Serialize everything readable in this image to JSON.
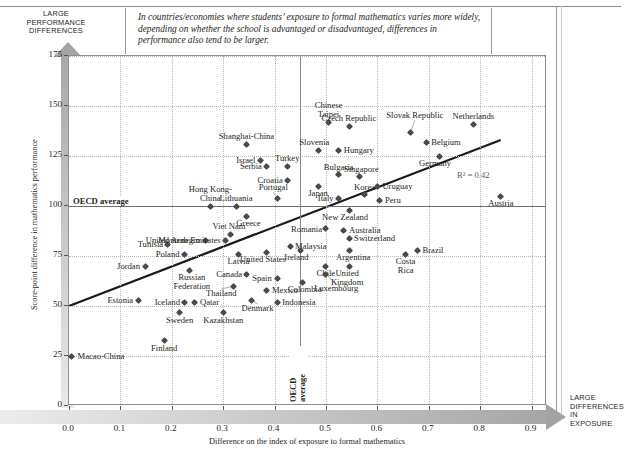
{
  "callouts": {
    "top_left": "LARGE PERFORMANCE DIFFERENCES",
    "bottom_right": "LARGE DIFFERENCES IN EXPOSURE"
  },
  "caption": "In countries/economies where students’ exposure to formal mathematics varies more widely, depending on whether the school is advantaged or disadvantaged, differences in performance also tend to be larger.",
  "annotations": {
    "oecd_average_horizontal": "OECD average",
    "oecd_average_vertical": "OECD average",
    "r_squared": "R² = 0.42"
  },
  "chart_data": {
    "type": "scatter",
    "title": "",
    "xlabel": "Difference on the index of exposure to formal mathematics",
    "ylabel": "Score-point difference in mathematics performance",
    "xlim": [
      0.0,
      0.93
    ],
    "ylim": [
      0,
      175
    ],
    "xticks": [
      "0.0",
      "0.1",
      "0.2",
      "0.3",
      "0.4",
      "0.5",
      "0.6",
      "0.7",
      "0.8",
      "0.9"
    ],
    "xtickvals": [
      0.0,
      0.1,
      0.2,
      0.3,
      0.4,
      0.5,
      0.6,
      0.7,
      0.8,
      0.9
    ],
    "yticks": [
      "0",
      "25",
      "50",
      "75",
      "100",
      "125",
      "150",
      "175"
    ],
    "ytickvals": [
      0,
      25,
      50,
      75,
      100,
      125,
      150,
      175
    ],
    "grid": true,
    "legend": "none",
    "reference_lines": {
      "oecd_average_y": 100,
      "oecd_average_x": 0.45
    },
    "trendline": {
      "x0": 0.0,
      "y0": 50,
      "x1": 0.84,
      "y1": 133,
      "r_squared": 0.42
    },
    "points": [
      {
        "name": "Macao-China",
        "x": 0.005,
        "y": 25,
        "lx": 1,
        "ly": 0,
        "anchor": "left"
      },
      {
        "name": "Finland",
        "x": 0.185,
        "y": 33,
        "lx": 0,
        "ly": 1,
        "anchor": "center"
      },
      {
        "name": "Estonia",
        "x": 0.135,
        "y": 53,
        "lx": -1,
        "ly": 0,
        "anchor": "right"
      },
      {
        "name": "Iceland",
        "x": 0.225,
        "y": 52,
        "lx": -1,
        "ly": 0,
        "anchor": "right"
      },
      {
        "name": "Qatar",
        "x": 0.245,
        "y": 52,
        "lx": 1,
        "ly": 0,
        "anchor": "left"
      },
      {
        "name": "Sweden",
        "x": 0.215,
        "y": 47,
        "lx": 0,
        "ly": 1,
        "anchor": "center"
      },
      {
        "name": "Kazakhstan",
        "x": 0.3,
        "y": 47,
        "lx": 0,
        "ly": 1,
        "anchor": "center"
      },
      {
        "name": "Denmark",
        "x": 0.355,
        "y": 53,
        "lx": 1,
        "ly": 0,
        "anchor": "left"
      },
      {
        "name": "Thailand",
        "x": 0.32,
        "y": 60,
        "lx": 0,
        "ly": 1,
        "anchor": "center"
      },
      {
        "name": "Mexico",
        "x": 0.385,
        "y": 58,
        "lx": 1,
        "ly": 0,
        "anchor": "left"
      },
      {
        "name": "Indonesia",
        "x": 0.405,
        "y": 52,
        "lx": 1,
        "ly": 0,
        "anchor": "left"
      },
      {
        "name": "Spain",
        "x": 0.405,
        "y": 64,
        "lx": -1,
        "ly": 0,
        "anchor": "right"
      },
      {
        "name": "Canada",
        "x": 0.345,
        "y": 66,
        "lx": -1,
        "ly": 0,
        "anchor": "right"
      },
      {
        "name": "Russian Federation",
        "x": 0.235,
        "y": 68,
        "lx": 0,
        "ly": 1,
        "anchor": "center"
      },
      {
        "name": "Jordan",
        "x": 0.148,
        "y": 70,
        "lx": -1,
        "ly": 0,
        "anchor": "right"
      },
      {
        "name": "Poland",
        "x": 0.225,
        "y": 76,
        "lx": -1,
        "ly": 0,
        "anchor": "right"
      },
      {
        "name": "Tunisia",
        "x": 0.192,
        "y": 81,
        "lx": -1,
        "ly": 0,
        "anchor": "right"
      },
      {
        "name": "Montenegro",
        "x": 0.265,
        "y": 83,
        "lx": -1,
        "ly": 0,
        "anchor": "right"
      },
      {
        "name": "Latvia",
        "x": 0.33,
        "y": 76,
        "lx": 0,
        "ly": 1,
        "anchor": "center"
      },
      {
        "name": "United States",
        "x": 0.385,
        "y": 77,
        "lx": 0,
        "ly": 1,
        "anchor": "center"
      },
      {
        "name": "Malaysia",
        "x": 0.43,
        "y": 80,
        "lx": 1,
        "ly": 0,
        "anchor": "left"
      },
      {
        "name": "Colombia",
        "x": 0.455,
        "y": 62,
        "lx": -1,
        "ly": 0,
        "anchor": "right"
      },
      {
        "name": "Chile",
        "x": 0.5,
        "y": 70,
        "lx": 0,
        "ly": 1,
        "anchor": "center"
      },
      {
        "name": "United Kingdom",
        "x": 0.545,
        "y": 70,
        "lx": 0,
        "ly": 1,
        "anchor": "center"
      },
      {
        "name": "Argentina",
        "x": 0.545,
        "y": 78,
        "lx": 0,
        "ly": 1,
        "anchor": "center"
      },
      {
        "name": "Luxembourg",
        "x": 0.5,
        "y": 66,
        "lx": 0,
        "ly": 1,
        "anchor": "center"
      },
      {
        "name": "Costa Rica",
        "x": 0.655,
        "y": 76,
        "lx": 0,
        "ly": 1,
        "anchor": "center"
      },
      {
        "name": "Brazil",
        "x": 0.678,
        "y": 78,
        "lx": 1,
        "ly": 0,
        "anchor": "left"
      },
      {
        "name": "Switzerland",
        "x": 0.545,
        "y": 84,
        "lx": 1,
        "ly": 0,
        "anchor": "left"
      },
      {
        "name": "Australia",
        "x": 0.535,
        "y": 88,
        "lx": 1,
        "ly": 0,
        "anchor": "left"
      },
      {
        "name": "Romania",
        "x": 0.5,
        "y": 89,
        "lx": -1,
        "ly": 0,
        "anchor": "right"
      },
      {
        "name": "Ireland",
        "x": 0.45,
        "y": 78,
        "lx": 0,
        "ly": 1,
        "anchor": "center"
      },
      {
        "name": "New Zealand",
        "x": 0.545,
        "y": 98,
        "lx": 0,
        "ly": 1,
        "anchor": "center"
      },
      {
        "name": "Italy",
        "x": 0.525,
        "y": 104,
        "lx": -1,
        "ly": 0,
        "anchor": "right"
      },
      {
        "name": "Peru",
        "x": 0.605,
        "y": 103,
        "lx": 1,
        "ly": 0,
        "anchor": "left"
      },
      {
        "name": "Uruguay",
        "x": 0.6,
        "y": 110,
        "lx": 1,
        "ly": 0,
        "anchor": "left"
      },
      {
        "name": "Austria",
        "x": 0.84,
        "y": 105,
        "lx": 0,
        "ly": 1,
        "anchor": "center"
      },
      {
        "name": "Korea",
        "x": 0.575,
        "y": 106,
        "lx": 0,
        "ly": 1,
        "anchor": "center"
      },
      {
        "name": "Japan",
        "x": 0.485,
        "y": 110,
        "lx": 0,
        "ly": 1,
        "anchor": "center"
      },
      {
        "name": "Singapore",
        "x": 0.565,
        "y": 115,
        "lx": 0,
        "ly": 1,
        "anchor": "center"
      },
      {
        "name": "Bulgaria",
        "x": 0.525,
        "y": 116,
        "lx": 0,
        "ly": 1,
        "anchor": "center"
      },
      {
        "name": "Greece",
        "x": 0.345,
        "y": 95,
        "lx": 0,
        "ly": 1,
        "anchor": "center"
      },
      {
        "name": "Viet Nam",
        "x": 0.315,
        "y": 86,
        "lx": 0,
        "ly": 1,
        "anchor": "center"
      },
      {
        "name": "United Arab Emirates",
        "x": 0.305,
        "y": 83,
        "lx": -1,
        "ly": 0,
        "anchor": "right"
      },
      {
        "name": "Lithuania",
        "x": 0.325,
        "y": 100,
        "lx": 0,
        "ly": 1,
        "anchor": "center"
      },
      {
        "name": "Hong Kong-China",
        "x": 0.275,
        "y": 100,
        "lx": 0,
        "ly": 1,
        "anchor": "center"
      },
      {
        "name": "Portugal",
        "x": 0.405,
        "y": 104,
        "lx": 0,
        "ly": 1,
        "anchor": "center"
      },
      {
        "name": "Croatia",
        "x": 0.425,
        "y": 113,
        "lx": -1,
        "ly": 0,
        "anchor": "right"
      },
      {
        "name": "Serbia",
        "x": 0.385,
        "y": 120,
        "lx": -1,
        "ly": 0,
        "anchor": "right"
      },
      {
        "name": "Turkey",
        "x": 0.425,
        "y": 120,
        "lx": 0,
        "ly": 1,
        "anchor": "center"
      },
      {
        "name": "Israel",
        "x": 0.372,
        "y": 123,
        "lx": -1,
        "ly": 0,
        "anchor": "right"
      },
      {
        "name": "Shanghai-China",
        "x": 0.345,
        "y": 131,
        "lx": 0,
        "ly": 1,
        "anchor": "center"
      },
      {
        "name": "Slovenia",
        "x": 0.485,
        "y": 128,
        "lx": 0,
        "ly": 1,
        "anchor": "center"
      },
      {
        "name": "Hungary",
        "x": 0.525,
        "y": 128,
        "lx": 1,
        "ly": 0,
        "anchor": "left"
      },
      {
        "name": "Chinese Taipei",
        "x": 0.505,
        "y": 142,
        "lx": 0,
        "ly": 1,
        "anchor": "center"
      },
      {
        "name": "Czech Republic",
        "x": 0.545,
        "y": 140,
        "lx": 0,
        "ly": 1,
        "anchor": "center"
      },
      {
        "name": "Slovak Republic",
        "x": 0.665,
        "y": 137,
        "lx": 0,
        "ly": 1,
        "anchor": "center"
      },
      {
        "name": "Belgium",
        "x": 0.695,
        "y": 132,
        "lx": 1,
        "ly": 0,
        "anchor": "left"
      },
      {
        "name": "Germany",
        "x": 0.72,
        "y": 125,
        "lx": 0,
        "ly": 1,
        "anchor": "center"
      },
      {
        "name": "Netherlands",
        "x": 0.787,
        "y": 141,
        "lx": 0,
        "ly": 1,
        "anchor": "center"
      }
    ]
  }
}
